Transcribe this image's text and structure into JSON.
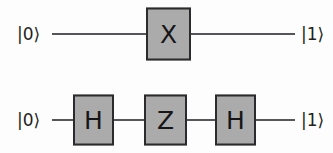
{
  "diagram": {
    "background_color": "#fdfdfd",
    "gate_fill_color": "#ababab",
    "gate_border_color": "#2b2b2d",
    "wire_color": "#54565a",
    "text_color": "#231f20"
  },
  "rows": [
    {
      "id": "row-1",
      "wire_y": 34,
      "input_label": "|0⟩",
      "output_label": "|1⟩",
      "gates": [
        {
          "label": "X",
          "x": 146,
          "width": 45,
          "height": 53
        }
      ],
      "wires": [
        {
          "x": 52,
          "width": 94
        },
        {
          "x": 191,
          "width": 104
        }
      ]
    },
    {
      "id": "row-2",
      "wire_y": 120,
      "input_label": "|0⟩",
      "output_label": "|1⟩",
      "gates": [
        {
          "label": "H",
          "x": 73,
          "width": 41,
          "height": 51
        },
        {
          "label": "Z",
          "x": 144,
          "width": 43,
          "height": 51
        },
        {
          "label": "H",
          "x": 215,
          "width": 41,
          "height": 51
        }
      ],
      "wires": [
        {
          "x": 52,
          "width": 21
        },
        {
          "x": 114,
          "width": 30
        },
        {
          "x": 187,
          "width": 28
        },
        {
          "x": 256,
          "width": 39
        }
      ]
    }
  ],
  "labels": {
    "input_x": 17,
    "output_x": 301
  }
}
